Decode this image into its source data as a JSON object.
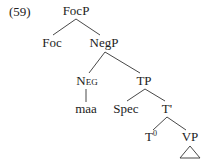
{
  "example_number": "(59)",
  "nodes": {
    "focp": "FocP",
    "foc": "Foc",
    "negp": "NegP",
    "neg": "Neg",
    "tp": "TP",
    "maa": "maa",
    "spec": "Spec",
    "tbar": "T'",
    "t0_base": "T",
    "t0_sup": "0",
    "vp": "VP"
  }
}
